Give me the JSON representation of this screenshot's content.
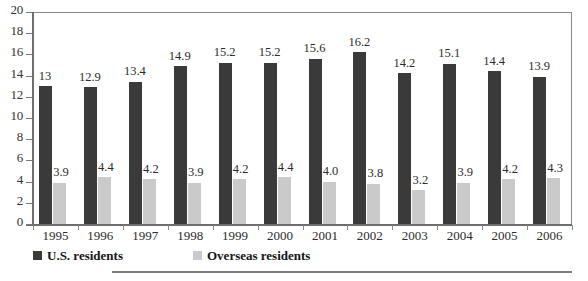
{
  "chart_data": {
    "type": "bar",
    "title": "",
    "subtitle": "",
    "xlabel": "",
    "ylabel": "",
    "ylim": [
      0,
      20
    ],
    "yticks": [
      0,
      2,
      4,
      6,
      8,
      10,
      12,
      14,
      16,
      18,
      20
    ],
    "ytick_labels": [
      "0",
      "2",
      "4",
      "6",
      "8",
      "10",
      "12",
      "14",
      "16",
      "18",
      "20"
    ],
    "grid": false,
    "legend_position": "bottom-left",
    "categories": [
      "1995",
      "1996",
      "1997",
      "1998",
      "1999",
      "2000",
      "2001",
      "2002",
      "2003",
      "2004",
      "2005",
      "2006"
    ],
    "series": [
      {
        "name": "U.S. residents",
        "color": "#3a3a3a",
        "values": [
          13,
          12.9,
          13.4,
          14.9,
          15.2,
          15.2,
          15.6,
          16.2,
          14.2,
          15.1,
          14.4,
          13.9
        ],
        "labels": [
          "13",
          "12.9",
          "13.4",
          "14.9",
          "15.2",
          "15.2",
          "15.6",
          "16.2",
          "14.2",
          "15.1",
          "14.4",
          "13.9"
        ]
      },
      {
        "name": "Overseas residents",
        "color": "#cacaca",
        "values": [
          3.9,
          4.4,
          4.2,
          3.9,
          4.2,
          4.4,
          4.0,
          3.8,
          3.2,
          3.9,
          4.2,
          4.3
        ],
        "labels": [
          "3.9",
          "4.4",
          "4.2",
          "3.9",
          "4.2",
          "4.4",
          "4.0",
          "3.8",
          "3.2",
          "3.9",
          "4.2",
          "4.3"
        ]
      }
    ]
  },
  "legend": {
    "items": [
      {
        "label": "U.S. residents",
        "swatch": "us"
      },
      {
        "label": "Overseas residents",
        "swatch": "ov"
      }
    ]
  },
  "colors": {
    "series_us": "#3a3a3a",
    "series_overseas": "#cacaca",
    "axis": "#7a7a7a",
    "text": "#2b2b2b",
    "background": "#ffffff"
  }
}
